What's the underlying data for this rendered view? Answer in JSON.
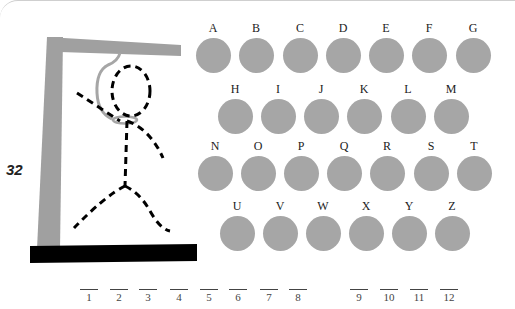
{
  "puzzle": {
    "number": "32"
  },
  "colors": {
    "gallows": "#a0a0a0",
    "base": "#000000",
    "rope": "#a6a6a6",
    "figure": "#000000",
    "letter_disc": "#a6a6a6"
  },
  "letters": {
    "row1": [
      "A",
      "B",
      "C",
      "D",
      "E",
      "F",
      "G"
    ],
    "row2": [
      "H",
      "I",
      "J",
      "K",
      "L",
      "M"
    ],
    "row3": [
      "N",
      "O",
      "P",
      "Q",
      "R",
      "S",
      "T"
    ],
    "row4": [
      "U",
      "V",
      "W",
      "X",
      "Y",
      "Z"
    ]
  },
  "answer_blanks": {
    "word1": [
      "1",
      "2",
      "3",
      "4",
      "5",
      "6",
      "7",
      "8"
    ],
    "word2": [
      "9",
      "10",
      "11",
      "12"
    ]
  }
}
